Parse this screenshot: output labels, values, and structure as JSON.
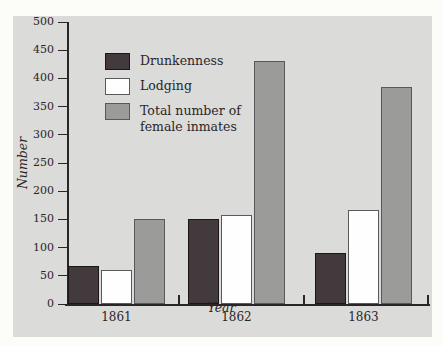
{
  "figure": {
    "background_color": "#fcfcf9",
    "panel_color": "#dbdbd9",
    "axis_color": "#2a2628"
  },
  "chart_data": {
    "type": "bar",
    "title": "",
    "categories": [
      "1861",
      "1862",
      "1863"
    ],
    "series": [
      {
        "name": "Drunkenness",
        "color": "#423a3c",
        "border_color": "#1b1718",
        "values": [
          68,
          150,
          90
        ]
      },
      {
        "name": "Lodging",
        "color": "#fefefe",
        "border_color": "#5a5a5a",
        "values": [
          60,
          158,
          167
        ]
      },
      {
        "name": "Total number of female inmates",
        "color": "#9b9b99",
        "border_color": "#58585a",
        "values": [
          150,
          430,
          385
        ]
      }
    ],
    "xlabel": "Year",
    "ylabel": "Number",
    "ylim": [
      0,
      500
    ],
    "ytick_labels": [
      "0",
      "50",
      "100",
      "150",
      "200",
      "250",
      "300",
      "350",
      "400",
      "450",
      "500"
    ],
    "grid": false,
    "legend_position": "top-left-inside"
  }
}
